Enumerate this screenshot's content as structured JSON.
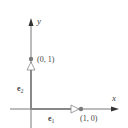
{
  "diagram": {
    "axes": {
      "x_label": "x",
      "y_label": "y"
    },
    "vectors": [
      {
        "name": "e1",
        "label_base": "e",
        "label_sub": "1",
        "from": [
          0,
          0
        ],
        "to": [
          1,
          0
        ]
      },
      {
        "name": "e2",
        "label_base": "e",
        "label_sub": "2",
        "from": [
          0,
          0
        ],
        "to": [
          0,
          1
        ]
      }
    ],
    "points": [
      {
        "label": "(1, 0)",
        "coords": [
          1,
          0
        ]
      },
      {
        "label": "(0, 1)",
        "coords": [
          0,
          1
        ]
      }
    ],
    "colors": {
      "axis": "#555555",
      "vector": "#888888",
      "point": "#7a7a7a",
      "text": "#444444"
    }
  }
}
